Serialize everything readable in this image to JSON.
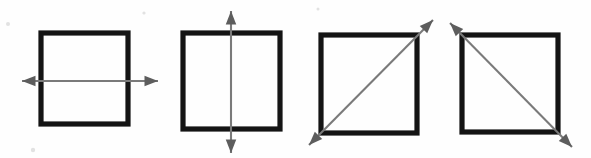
{
  "figure": {
    "background_color": "#fefefe",
    "square_stroke_color": "#141414",
    "axis_stroke_color": "#7a7a7a",
    "arrowhead_color": "#5d5d5d",
    "width": 591,
    "height": 158,
    "panel_count": 4
  },
  "panels": [
    {
      "index": 1,
      "name": "horizontal-symmetry-axis",
      "label": "Horizontal line of symmetry",
      "square": {
        "x": 41,
        "y": 33,
        "width": 87,
        "height": 91
      },
      "axis": {
        "type": "horizontal",
        "angle_degrees": 0,
        "x1": 22,
        "y1": 81,
        "x2": 158,
        "y2": 81,
        "double_headed": true
      }
    },
    {
      "index": 2,
      "name": "vertical-symmetry-axis",
      "label": "Vertical line of symmetry",
      "square": {
        "x": 183,
        "y": 33,
        "width": 97,
        "height": 96
      },
      "axis": {
        "type": "vertical",
        "angle_degrees": 90,
        "x1": 231,
        "y1": 11,
        "x2": 231,
        "y2": 153,
        "double_headed": true
      }
    },
    {
      "index": 3,
      "name": "main-diagonal-symmetry-axis",
      "label": "Diagonal line of symmetry, bottom-left to top-right",
      "square": {
        "x": 321,
        "y": 35,
        "width": 96,
        "height": 98
      },
      "axis": {
        "type": "diagonal-rising",
        "angle_degrees": 45,
        "x1": 309,
        "y1": 145,
        "x2": 433,
        "y2": 20,
        "double_headed": true
      }
    },
    {
      "index": 4,
      "name": "anti-diagonal-symmetry-axis",
      "label": "Diagonal line of symmetry, top-left to bottom-right",
      "square": {
        "x": 462,
        "y": 35,
        "width": 96,
        "height": 97
      },
      "axis": {
        "type": "diagonal-falling",
        "angle_degrees": -45,
        "x1": 450,
        "y1": 23,
        "x2": 572,
        "y2": 147,
        "double_headed": true
      }
    }
  ]
}
